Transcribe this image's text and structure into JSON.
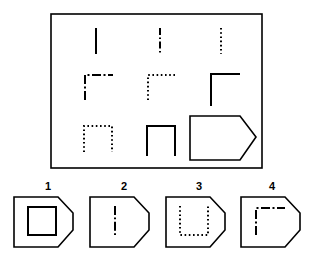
{
  "puzzle": {
    "type": "matrix-reasoning",
    "title": "",
    "matrix": {
      "frame": {
        "x": 51,
        "y": 14,
        "width": 211,
        "height": 154,
        "stroke": "#000000",
        "stroke_width": 1.6
      },
      "rows": 3,
      "cols": 3,
      "cells": [
        {
          "row": 1,
          "col": 1,
          "shape": "vertical-line",
          "line_style": "solid",
          "label": "solid vertical line"
        },
        {
          "row": 1,
          "col": 2,
          "shape": "vertical-line",
          "line_style": "dash-dot",
          "label": "dash-dot vertical line"
        },
        {
          "row": 1,
          "col": 3,
          "shape": "vertical-line",
          "line_style": "dotted",
          "label": "dotted vertical line"
        },
        {
          "row": 2,
          "col": 1,
          "shape": "corner-L",
          "line_style": "dash-dot",
          "label": "dash-dot corner"
        },
        {
          "row": 2,
          "col": 2,
          "shape": "corner-L",
          "line_style": "dotted",
          "label": "dotted corner"
        },
        {
          "row": 2,
          "col": 3,
          "shape": "corner-L",
          "line_style": "solid",
          "label": "solid corner"
        },
        {
          "row": 3,
          "col": 1,
          "shape": "inverted-u",
          "line_style": "dotted",
          "label": "dotted inverted U"
        },
        {
          "row": 3,
          "col": 2,
          "shape": "inverted-u",
          "line_style": "solid",
          "label": "solid inverted U"
        },
        {
          "row": 3,
          "col": 3,
          "shape": "answer-blank",
          "line_style": "solid",
          "label": "blank answer cell"
        }
      ]
    },
    "options": [
      {
        "number": "1",
        "shape": "square",
        "line_style": "solid",
        "label": "solid square"
      },
      {
        "number": "2",
        "shape": "vertical-line",
        "line_style": "dash-dot",
        "label": "dash-dot vertical line"
      },
      {
        "number": "3",
        "shape": "u-shape",
        "line_style": "dotted",
        "label": "dotted U shape"
      },
      {
        "number": "4",
        "shape": "corner-L",
        "line_style": "dash-dot",
        "label": "dash-dot corner"
      }
    ],
    "colors": {
      "ink": "#000000",
      "background": "#ffffff"
    }
  }
}
